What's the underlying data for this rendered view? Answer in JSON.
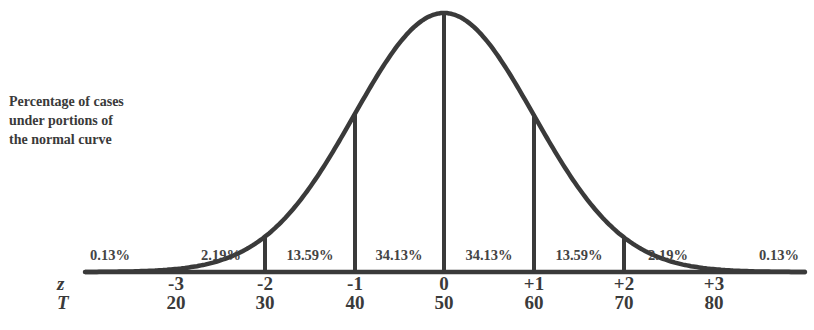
{
  "caption": {
    "lines": [
      "Percentage of cases",
      "under portions of",
      "the normal curve"
    ]
  },
  "axis_labels": {
    "z": "z",
    "T": "T"
  },
  "regions": [
    {
      "label": "0.13%",
      "x": 110
    },
    {
      "label": "2.19%",
      "x": 221
    },
    {
      "label": "13.59%",
      "x": 310
    },
    {
      "label": "34.13%",
      "x": 399
    },
    {
      "label": "34.13%",
      "x": 489
    },
    {
      "label": "13.59%",
      "x": 579
    },
    {
      "label": "2.19%",
      "x": 668
    },
    {
      "label": "0.13%",
      "x": 779
    }
  ],
  "ticks": [
    {
      "z": "-3",
      "T": "20",
      "x": 176
    },
    {
      "z": "-2",
      "T": "30",
      "x": 265
    },
    {
      "z": "-1",
      "T": "40",
      "x": 355
    },
    {
      "z": "0",
      "T": "50",
      "x": 444
    },
    {
      "z": "+1",
      "T": "60",
      "x": 534
    },
    {
      "z": "+2",
      "T": "70",
      "x": 624
    },
    {
      "z": "+3",
      "T": "80",
      "x": 714
    }
  ],
  "colors": {
    "stroke": "#3a3a3a",
    "text": "#3a3a3a",
    "background": "#ffffff"
  },
  "chart_data": {
    "type": "area",
    "title": "Percentage of cases under portions of the normal curve",
    "x": [
      "-3",
      "-2",
      "-1",
      "0",
      "+1",
      "+2",
      "+3"
    ],
    "x_secondary": [
      "20",
      "30",
      "40",
      "50",
      "60",
      "70",
      "80"
    ],
    "xlabel": "z",
    "xlabel_secondary": "T",
    "regions": [
      {
        "range": "< -3",
        "percent": 0.13
      },
      {
        "range": "-3 to -2",
        "percent": 2.19
      },
      {
        "range": "-2 to -1",
        "percent": 13.59
      },
      {
        "range": "-1 to 0",
        "percent": 34.13
      },
      {
        "range": "0 to +1",
        "percent": 34.13
      },
      {
        "range": "+1 to +2",
        "percent": 13.59
      },
      {
        "range": "+2 to +3",
        "percent": 2.19
      },
      {
        "range": "> +3",
        "percent": 0.13
      }
    ],
    "grid": false,
    "legend": "none"
  }
}
